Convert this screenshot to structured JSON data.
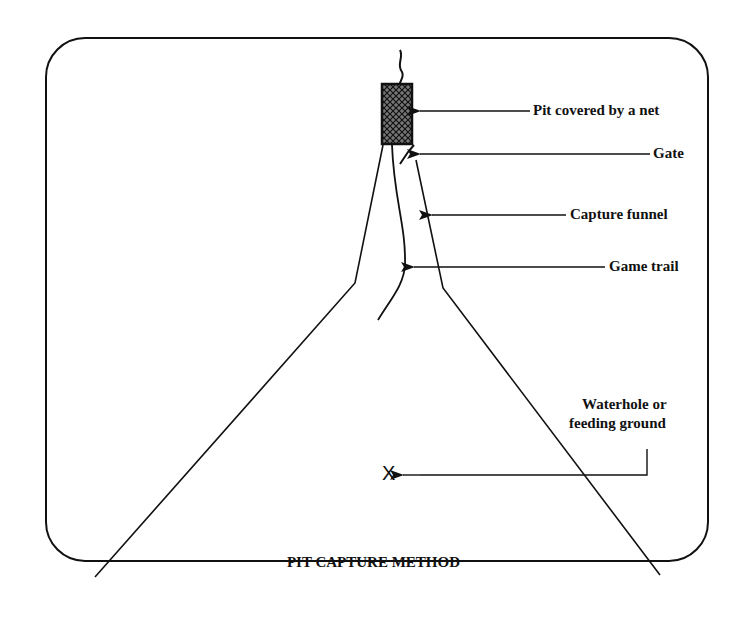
{
  "title": "PIT CAPTURE METHOD",
  "labels": {
    "pit": "Pit covered by a net",
    "gate": "Gate",
    "funnel": "Capture funnel",
    "trail": "Game trail",
    "waterhole_line1": "Waterhole or",
    "waterhole_line2": "feeding ground"
  },
  "marker": "X",
  "colors": {
    "ink": "#111111",
    "background": "#ffffff"
  }
}
